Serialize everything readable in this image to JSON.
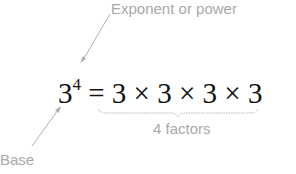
{
  "diagram": {
    "exponent_label": "Exponent or power",
    "base_label": "Base",
    "factors_label": "4 factors",
    "equation": {
      "base": "3",
      "exponent": "4",
      "rhs": "= 3 × 3 × 3 × 3"
    },
    "colors": {
      "annotation": "#a9a9a9",
      "equation": "#111111"
    }
  }
}
